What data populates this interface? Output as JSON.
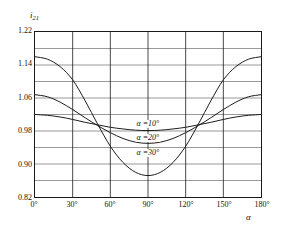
{
  "chart_data": {
    "type": "line",
    "title": "",
    "xlabel": "α",
    "ylabel": "i21",
    "ylabel_base": "i",
    "ylabel_sub": "21",
    "xlim": [
      0,
      180
    ],
    "ylim": [
      0.82,
      1.22
    ],
    "grid": true,
    "grid_minor_step_y": 0.04,
    "grid_step_x": 30,
    "legend_position": "inline-on-curves",
    "x_tick_labels": [
      "0°",
      "30°",
      "60°",
      "90°",
      "120°",
      "150°",
      "180°"
    ],
    "x_tick_values": [
      0,
      30,
      60,
      90,
      120,
      150,
      180
    ],
    "y_tick_labels": [
      "0.82",
      "0.90",
      "0.98",
      "1.06",
      "1.14",
      "1.22"
    ],
    "y_tick_values": [
      0.82,
      0.9,
      0.98,
      1.06,
      1.14,
      1.22
    ],
    "y_minor_values": [
      0.86,
      0.94,
      1.02,
      1.1,
      1.18
    ],
    "x": [
      0,
      10,
      20,
      30,
      40,
      50,
      60,
      70,
      80,
      90,
      100,
      110,
      120,
      130,
      140,
      150,
      160,
      170,
      180
    ],
    "series": [
      {
        "name": "α =10°",
        "label": "α =10°",
        "color": "#1a1a1a",
        "values": [
          1.02,
          1.018,
          1.014,
          1.008,
          1.001,
          0.995,
          0.989,
          0.985,
          0.982,
          0.981,
          0.982,
          0.985,
          0.989,
          0.995,
          1.001,
          1.008,
          1.014,
          1.018,
          1.02
        ]
      },
      {
        "name": "α =20°",
        "label": "α =20°",
        "color": "#1a1a1a",
        "values": [
          1.068,
          1.063,
          1.05,
          1.032,
          1.012,
          0.993,
          0.976,
          0.962,
          0.953,
          0.95,
          0.953,
          0.962,
          0.976,
          0.993,
          1.012,
          1.032,
          1.05,
          1.063,
          1.068
        ]
      },
      {
        "name": "α =30°",
        "label": "α =30°",
        "color": "#1a1a1a",
        "values": [
          1.16,
          1.154,
          1.136,
          1.104,
          1.053,
          0.996,
          0.943,
          0.904,
          0.88,
          0.872,
          0.88,
          0.904,
          0.943,
          0.996,
          1.053,
          1.104,
          1.136,
          1.154,
          1.16
        ]
      }
    ],
    "annotations": [
      {
        "text": "α =10°",
        "x": 90,
        "y": 0.996
      },
      {
        "text": "α =20°",
        "x": 90,
        "y": 0.962
      },
      {
        "text": "α =30°",
        "x": 90,
        "y": 0.925
      }
    ]
  },
  "caption": {
    "text": ""
  },
  "colors": {
    "curve": "#1a1a1a",
    "grid": "#7d7d7d",
    "frame": "#1a1a1a",
    "background": "#ffffff"
  }
}
